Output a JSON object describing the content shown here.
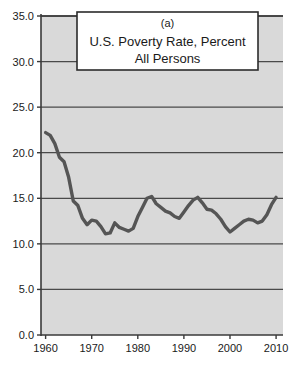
{
  "figure": {
    "panel_label": "(a)",
    "title_line1": "U.S. Poverty Rate, Percent",
    "title_line2": "All Persons",
    "plot_bg_color": "#d9d9d9",
    "page_bg_color": "#ffffff",
    "axis_color": "#3a3a3a",
    "grid_color": "#4a4a4a",
    "series_color": "#555555",
    "title_box_bg": "#ffffff",
    "title_box_border": "#2b2b2b"
  },
  "chart_data": {
    "type": "line",
    "title": "(a) U.S. Poverty Rate, Percent All Persons",
    "subtitle": "All Persons",
    "xlabel": "",
    "ylabel": "",
    "xlim": [
      1959,
      2011.5
    ],
    "ylim": [
      0.0,
      35.0
    ],
    "grid": true,
    "legend_position": "none",
    "ytick_labels": [
      "0.0",
      "5.0",
      "10.0",
      "15.0",
      "20.0",
      "25.0",
      "30.0",
      "35.0"
    ],
    "ytick_values": [
      0.0,
      5.0,
      10.0,
      15.0,
      20.0,
      25.0,
      30.0,
      35.0
    ],
    "xtick_labels": [
      "1960",
      "1970",
      "1980",
      "1990",
      "2000",
      "2010"
    ],
    "xtick_values": [
      1960,
      1970,
      1980,
      1990,
      2000,
      2010
    ],
    "series": [
      {
        "name": "U.S. Poverty Rate, All Persons",
        "x": [
          1960,
          1961,
          1962,
          1963,
          1964,
          1965,
          1966,
          1967,
          1968,
          1969,
          1970,
          1971,
          1972,
          1973,
          1974,
          1975,
          1976,
          1977,
          1978,
          1979,
          1980,
          1981,
          1982,
          1983,
          1984,
          1985,
          1986,
          1987,
          1988,
          1989,
          1990,
          1991,
          1992,
          1993,
          1994,
          1995,
          1996,
          1997,
          1998,
          1999,
          2000,
          2001,
          2002,
          2003,
          2004,
          2005,
          2006,
          2007,
          2008,
          2009,
          2010
        ],
        "values": [
          22.2,
          21.9,
          21.0,
          19.5,
          19.0,
          17.3,
          14.7,
          14.2,
          12.8,
          12.1,
          12.6,
          12.5,
          11.9,
          11.1,
          11.2,
          12.3,
          11.8,
          11.6,
          11.4,
          11.7,
          13.0,
          14.0,
          15.0,
          15.2,
          14.4,
          14.0,
          13.6,
          13.4,
          13.0,
          12.8,
          13.5,
          14.2,
          14.8,
          15.1,
          14.5,
          13.8,
          13.7,
          13.3,
          12.7,
          11.9,
          11.3,
          11.7,
          12.1,
          12.5,
          12.7,
          12.6,
          12.3,
          12.5,
          13.2,
          14.3,
          15.1
        ]
      }
    ]
  }
}
